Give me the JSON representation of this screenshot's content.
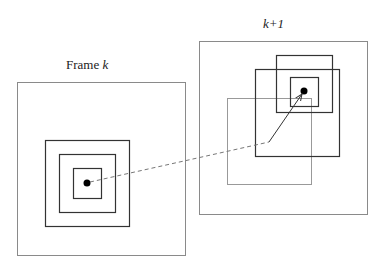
{
  "diagram": {
    "frame_left": {
      "label_prefix": "Frame ",
      "label_var": "k"
    },
    "frame_right": {
      "label": "k+1"
    },
    "colors": {
      "frame_border": "#8a8a8a",
      "box_stroke": "#333333",
      "light_box_stroke": "#999999",
      "dot": "#000000",
      "dashed_line": "#777777",
      "arrow": "#333333"
    }
  }
}
